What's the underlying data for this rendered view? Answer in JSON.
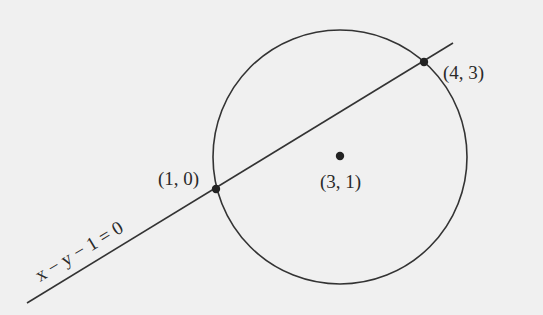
{
  "diagram": {
    "title": "",
    "colors": {
      "background": "#f0f0f0",
      "stroke": "#333333",
      "text": "#2a2a2a"
    },
    "circle": {
      "center_label": "(3, 1)",
      "center": {
        "x": 3,
        "y": 1
      }
    },
    "line": {
      "equation_label": "x − y − 1 = 0"
    },
    "points": [
      {
        "label": "(1, 0)",
        "x": 1,
        "y": 0
      },
      {
        "label": "(4, 3)",
        "x": 4,
        "y": 3
      }
    ]
  }
}
